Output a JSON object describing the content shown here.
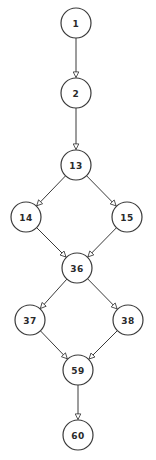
{
  "diagram": {
    "type": "directed-graph",
    "colors": {
      "background": "#ffffff",
      "stroke": "#3a3a3a",
      "text": "#2a2a2a"
    },
    "node_radius": 15,
    "nodes": [
      {
        "id": "1",
        "label": "1",
        "x": 76,
        "y": 23
      },
      {
        "id": "2",
        "label": "2",
        "x": 76,
        "y": 93
      },
      {
        "id": "13",
        "label": "13",
        "x": 76,
        "y": 165
      },
      {
        "id": "14",
        "label": "14",
        "x": 26,
        "y": 217
      },
      {
        "id": "15",
        "label": "15",
        "x": 127,
        "y": 217
      },
      {
        "id": "36",
        "label": "36",
        "x": 77,
        "y": 268
      },
      {
        "id": "37",
        "label": "37",
        "x": 30,
        "y": 320
      },
      {
        "id": "38",
        "label": "38",
        "x": 128,
        "y": 320
      },
      {
        "id": "59",
        "label": "59",
        "x": 78,
        "y": 370
      },
      {
        "id": "60",
        "label": "60",
        "x": 78,
        "y": 435
      }
    ],
    "edges": [
      {
        "from": "1",
        "to": "2"
      },
      {
        "from": "2",
        "to": "13"
      },
      {
        "from": "13",
        "to": "14"
      },
      {
        "from": "13",
        "to": "15"
      },
      {
        "from": "14",
        "to": "36"
      },
      {
        "from": "15",
        "to": "36"
      },
      {
        "from": "36",
        "to": "37"
      },
      {
        "from": "36",
        "to": "38"
      },
      {
        "from": "37",
        "to": "59"
      },
      {
        "from": "38",
        "to": "59"
      },
      {
        "from": "59",
        "to": "60"
      }
    ]
  }
}
